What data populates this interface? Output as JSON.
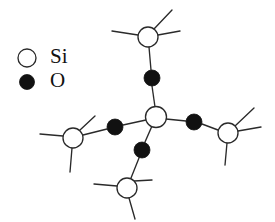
{
  "figure": {
    "width": 275,
    "height": 222,
    "background_color": "#ffffff"
  },
  "legend": {
    "items": [
      {
        "label": "Si",
        "marker": "open-circle",
        "marker_fill": "#ffffff",
        "marker_stroke": "#2a2a2a",
        "marker_cx": 27,
        "marker_cy": 58,
        "marker_r": 9,
        "label_x": 50,
        "label_y": 58
      },
      {
        "label": "O",
        "marker": "filled-circle",
        "marker_fill": "#111111",
        "marker_stroke": "#111111",
        "marker_cx": 27,
        "marker_cy": 82,
        "marker_r": 7.5,
        "label_x": 50,
        "label_y": 82
      }
    ]
  },
  "structure": {
    "bond_color": "#2a2a2a",
    "bond_width": 1.35,
    "silicon_atoms": [
      {
        "id": "si-center",
        "label": "Si",
        "cx": 156,
        "cy": 117,
        "r": 10.5
      },
      {
        "id": "si-top",
        "label": "Si",
        "cx": 148,
        "cy": 37,
        "r": 10
      },
      {
        "id": "si-left",
        "label": "Si",
        "cx": 73,
        "cy": 138,
        "r": 10
      },
      {
        "id": "si-right",
        "label": "Si",
        "cx": 228,
        "cy": 133,
        "r": 10
      },
      {
        "id": "si-bottom",
        "label": "Si",
        "cx": 127,
        "cy": 188,
        "r": 10
      }
    ],
    "oxygen_atoms": [
      {
        "id": "o-top",
        "label": "O",
        "cx": 152,
        "cy": 78,
        "r": 8
      },
      {
        "id": "o-left",
        "label": "O",
        "cx": 115,
        "cy": 127,
        "r": 8
      },
      {
        "id": "o-right",
        "label": "O",
        "cx": 194,
        "cy": 122,
        "r": 8
      },
      {
        "id": "o-bottom",
        "label": "O",
        "cx": 142,
        "cy": 150,
        "r": 8
      }
    ],
    "bonds": [
      {
        "id": "bond-center-otop",
        "x1": 155,
        "y1": 107,
        "x2": 152,
        "y2": 86
      },
      {
        "id": "bond-otop-sitop",
        "x1": 151,
        "y1": 70,
        "x2": 149,
        "y2": 47
      },
      {
        "id": "bond-center-oleft",
        "x1": 146,
        "y1": 120,
        "x2": 123,
        "y2": 125
      },
      {
        "id": "bond-oleft-sileft",
        "x1": 107,
        "y1": 129,
        "x2": 83,
        "y2": 135
      },
      {
        "id": "bond-center-oright",
        "x1": 166,
        "y1": 119,
        "x2": 186,
        "y2": 121
      },
      {
        "id": "bond-oright-siright",
        "x1": 202,
        "y1": 124,
        "x2": 218,
        "y2": 130
      },
      {
        "id": "bond-center-obottom",
        "x1": 152,
        "y1": 126,
        "x2": 145,
        "y2": 142
      },
      {
        "id": "bond-obottom-sibottom",
        "x1": 139,
        "y1": 158,
        "x2": 131,
        "y2": 178
      }
    ],
    "terminal_bonds": [
      {
        "id": "term-sitop-left",
        "x1": 138,
        "y1": 35,
        "x2": 112,
        "y2": 31
      },
      {
        "id": "term-sitop-upright",
        "x1": 154,
        "y1": 29,
        "x2": 172,
        "y2": 10
      },
      {
        "id": "term-sitop-right",
        "x1": 158,
        "y1": 35,
        "x2": 180,
        "y2": 31
      },
      {
        "id": "term-sileft-left",
        "x1": 63,
        "y1": 136,
        "x2": 40,
        "y2": 134
      },
      {
        "id": "term-sileft-upright",
        "x1": 80,
        "y1": 130,
        "x2": 95,
        "y2": 116
      },
      {
        "id": "term-sileft-down",
        "x1": 72,
        "y1": 148,
        "x2": 70,
        "y2": 172
      },
      {
        "id": "term-siright-upright",
        "x1": 235,
        "y1": 126,
        "x2": 254,
        "y2": 108
      },
      {
        "id": "term-siright-right",
        "x1": 238,
        "y1": 131,
        "x2": 261,
        "y2": 127
      },
      {
        "id": "term-siright-down",
        "x1": 227,
        "y1": 143,
        "x2": 225,
        "y2": 165
      },
      {
        "id": "term-sibottom-left",
        "x1": 117,
        "y1": 186,
        "x2": 94,
        "y2": 184
      },
      {
        "id": "term-sibottom-upright",
        "x1": 134,
        "y1": 181,
        "x2": 152,
        "y2": 180
      },
      {
        "id": "term-sibottom-down",
        "x1": 129,
        "y1": 198,
        "x2": 135,
        "y2": 219
      }
    ]
  }
}
